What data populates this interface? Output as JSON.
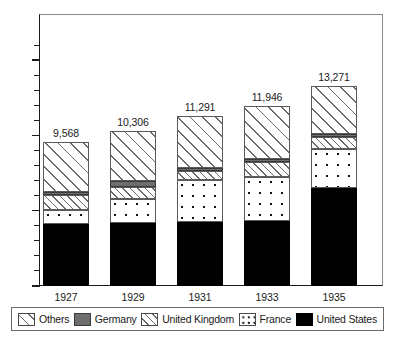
{
  "chart_data": {
    "type": "bar",
    "subtype": "stacked-bar",
    "title": "",
    "xlabel": "",
    "ylabel": "",
    "categories": [
      "1927",
      "1929",
      "1931",
      "1933",
      "1935"
    ],
    "series": [
      {
        "name": "United States",
        "key": "us",
        "values": [
          4150,
          4200,
          4250,
          4350,
          6500
        ]
      },
      {
        "name": "France",
        "key": "france",
        "values": [
          900,
          1600,
          2800,
          2900,
          2600
        ]
      },
      {
        "name": "United Kingdom",
        "key": "uk",
        "values": [
          1000,
          800,
          600,
          1000,
          800
        ]
      },
      {
        "name": "Germany",
        "key": "germany",
        "values": [
          200,
          400,
          200,
          200,
          200
        ]
      },
      {
        "name": "Others",
        "key": "others",
        "values": [
          3318,
          3306,
          3441,
          3496,
          3171
        ]
      }
    ],
    "totals": [
      9568,
      10306,
      11291,
      11946,
      13271
    ],
    "total_labels": [
      "9,568",
      "10,306",
      "11,291",
      "11,946",
      "13,271"
    ],
    "ylim": [
      0,
      16500
    ],
    "ytick_values": [
      0,
      5000,
      10000,
      15000
    ],
    "ytick_labels": [
      "0",
      "5,000",
      "10,000",
      "15,000"
    ],
    "yminor_step": 1000,
    "grid": false,
    "legend_position": "bottom",
    "stack_order_bottom_to_top": [
      "United States",
      "France",
      "United Kingdom",
      "Germany",
      "Others"
    ]
  },
  "legend": {
    "entries": [
      {
        "label": "Others",
        "swatch": "diagonal-hatch-wide"
      },
      {
        "label": "Germany",
        "swatch": "solid-gray"
      },
      {
        "label": "United Kingdom",
        "swatch": "diagonal-hatch-fine"
      },
      {
        "label": "France",
        "swatch": "dotted"
      },
      {
        "label": "United States",
        "swatch": "solid-black"
      }
    ]
  },
  "colors": {
    "united_states": "#000000",
    "germany": "#6e6e6e",
    "hatch_line": "#6b6b6b",
    "dot": "#111111",
    "axis": "#1a1a1a",
    "frame": "#8a8a8a",
    "background": "#ffffff"
  }
}
